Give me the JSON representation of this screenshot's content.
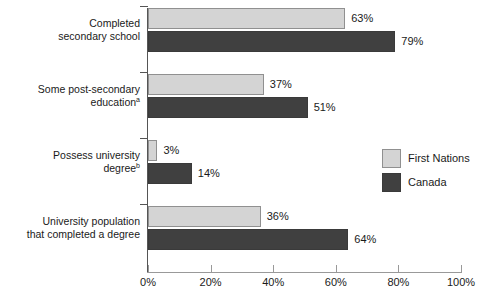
{
  "chart_data": {
    "type": "bar",
    "orientation": "horizontal",
    "title": "",
    "subtitle": "",
    "xlabel": "",
    "ylabel": "",
    "xlim": [
      0,
      100
    ],
    "grid": false,
    "legend_position": "right-middle",
    "categories": [
      "Completed\nsecondary school",
      "Some post-secondary\neducation",
      "Possess university\ndegree",
      "University population\nthat completed a degree"
    ],
    "category_footnotes": [
      "",
      "a",
      "b",
      ""
    ],
    "series": [
      {
        "name": "First Nations",
        "color": "#d4d4d4",
        "values": [
          63,
          37,
          3,
          36
        ]
      },
      {
        "name": "Canada",
        "color": "#404040",
        "values": [
          79,
          51,
          14,
          64
        ]
      }
    ],
    "value_labels": [
      [
        "63%",
        "37%",
        "3%",
        "36%"
      ],
      [
        "79%",
        "51%",
        "14%",
        "64%"
      ]
    ],
    "xticks": [
      0,
      20,
      40,
      60,
      80,
      100
    ],
    "xtick_labels": [
      "0%",
      "20%",
      "40%",
      "60%",
      "80%",
      "100%"
    ]
  },
  "legend": {
    "items": [
      {
        "label": "First Nations"
      },
      {
        "label": "Canada"
      }
    ]
  },
  "axis": {
    "x_labels": [
      "0%",
      "20%",
      "40%",
      "60%",
      "80%",
      "100%"
    ]
  }
}
